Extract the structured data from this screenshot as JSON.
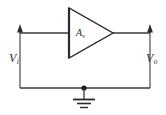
{
  "figure": {
    "kind": "voltage-amplifier-circuit-diagram",
    "background_color": "#ffffff",
    "wire_color": "#3a3a3a",
    "triangle_color": "#2a2a2a",
    "label_color": "#2a2a2a",
    "width": 166,
    "height": 115
  },
  "labels": {
    "input_voltage": "V",
    "input_voltage_sub": "i",
    "output_voltage": "V",
    "output_voltage_sub": "o",
    "gain": "A",
    "gain_sub": "v"
  },
  "components": {
    "amplifier": {
      "name": "amplifier-triangle",
      "label": "A",
      "label_sub": "v",
      "apex_x": 113,
      "apex_y": 33,
      "left_x": 68,
      "top_y": 8,
      "bottom_y": 58
    },
    "ground": {
      "name": "ground-symbol",
      "x": 84,
      "y": 88,
      "bar_widths": [
        22,
        14,
        8
      ]
    },
    "node_dot": {
      "x": 84,
      "y": 88,
      "radius": 2.6
    }
  },
  "wires": {
    "input_signal_line": {
      "x1": 20,
      "y1": 33,
      "x2": 68,
      "y2": 33
    },
    "output_signal_line": {
      "x1": 113,
      "y1": 33,
      "x2": 150,
      "y2": 33
    },
    "bottom_rail": {
      "x1": 20,
      "y1": 88,
      "x2": 150,
      "y2": 88
    },
    "input_arrow": {
      "x": 20,
      "y_from": 88,
      "y_to": 29,
      "direction": "up"
    },
    "output_arrow": {
      "x": 150,
      "y_from": 88,
      "y_to": 29,
      "direction": "up"
    }
  }
}
